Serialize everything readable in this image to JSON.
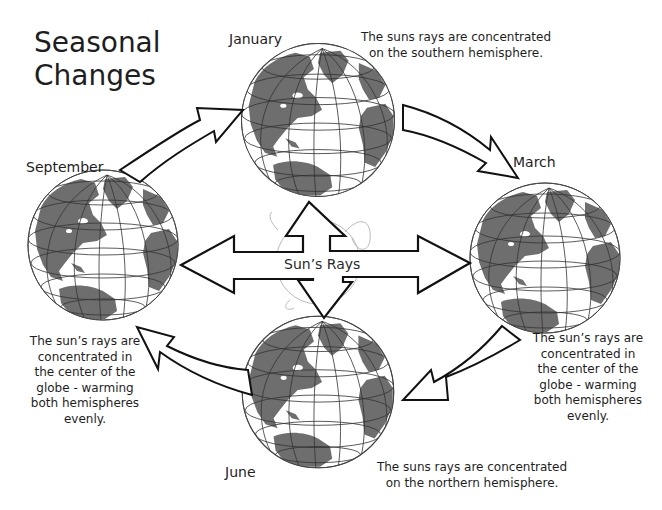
{
  "title": {
    "line1": "Seasonal",
    "line2": "Changes"
  },
  "center": {
    "label": "Sun’s Rays",
    "icon": "four-way-arrow-icon"
  },
  "globes": [
    {
      "id": "january",
      "month": "January",
      "note_lines": [
        "The suns rays are concentrated",
        "on the southern hemisphere."
      ]
    },
    {
      "id": "march",
      "month": "March",
      "note_lines": [
        "The sun’s rays are",
        "concentrated in",
        "the center of the",
        "globe - warming",
        "both hemispheres",
        "evenly."
      ]
    },
    {
      "id": "june",
      "month": "June",
      "note_lines": [
        "The suns rays are concentrated",
        "on the northern hemisphere."
      ]
    },
    {
      "id": "september",
      "month": "September",
      "note_lines": [
        "The sun’s rays are",
        "concentrated in",
        "the center of the",
        "globe - warming",
        "both hemispheres",
        "evenly."
      ]
    }
  ],
  "cycle_arrows": [
    {
      "from": "September",
      "to": "January"
    },
    {
      "from": "January",
      "to": "March"
    },
    {
      "from": "March",
      "to": "June"
    },
    {
      "from": "June",
      "to": "September"
    }
  ],
  "colors": {
    "land": "#6e6e6e",
    "outline": "#111111",
    "grid": "#333333",
    "background": "#ffffff"
  }
}
